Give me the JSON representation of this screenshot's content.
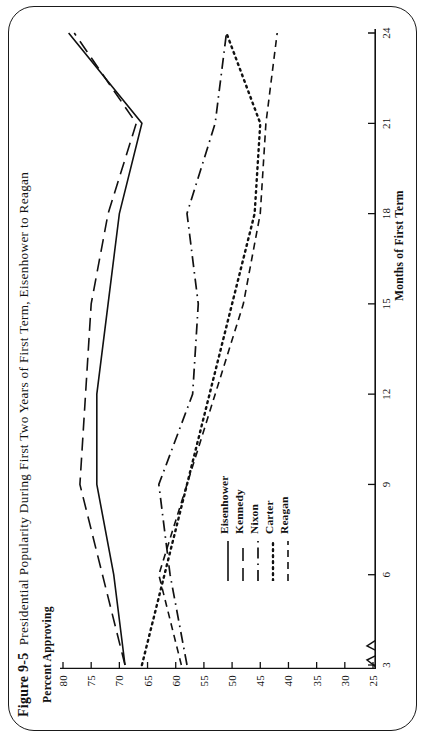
{
  "figure": {
    "number": "Figure 9-5",
    "title": "Presidential Popularity During First Two Years of First Term, Eisenhower to Reagan"
  },
  "axes": {
    "y_caption": "Percent Approving",
    "x_caption": "Months of First Term",
    "y_ticks": [
      "80",
      "75",
      "70",
      "65",
      "60",
      "55",
      "50",
      "45",
      "40",
      "35",
      "30",
      "25"
    ],
    "x_ticks": [
      "3",
      "6",
      "9",
      "12",
      "15",
      "18",
      "21",
      "24"
    ]
  },
  "legend": {
    "items": [
      {
        "label": "Eisenhower",
        "style": "solid"
      },
      {
        "label": "Kennedy",
        "style": "dashed"
      },
      {
        "label": "Nixon",
        "style": "dash-dot"
      },
      {
        "label": "Carter",
        "style": "dotted"
      },
      {
        "label": "Reagan",
        "style": "short-dashed"
      }
    ]
  },
  "chart_data": {
    "type": "line",
    "title": "Presidential Popularity During First Two Years of First Term, Eisenhower to Reagan",
    "xlabel": "Months of First Term",
    "ylabel": "Percent Approving",
    "xlim": [
      3,
      24
    ],
    "ylim": [
      25,
      80
    ],
    "grid": false,
    "legend_position": "lower-center-inside",
    "x": [
      3,
      6,
      9,
      12,
      15,
      18,
      21,
      24
    ],
    "series": [
      {
        "name": "Eisenhower",
        "style": "solid",
        "values": [
          69,
          71,
          74,
          74,
          72,
          70,
          66,
          79
        ]
      },
      {
        "name": "Kennedy",
        "style": "dashed",
        "values": [
          69,
          73,
          77,
          76,
          75,
          72,
          67,
          78
        ]
      },
      {
        "name": "Nixon",
        "style": "dash-dot",
        "values": [
          58,
          61,
          63,
          57,
          56,
          58,
          53,
          51
        ]
      },
      {
        "name": "Carter",
        "style": "dotted",
        "values": [
          66,
          62,
          58,
          54,
          50,
          46,
          45,
          51
        ]
      },
      {
        "name": "Reagan",
        "style": "short-dashed",
        "values": [
          59,
          63,
          58,
          53,
          48,
          45,
          44,
          42
        ]
      }
    ]
  },
  "colors": {
    "ink": "#111111",
    "frame": "#1a1a1a",
    "paper": "#ffffff"
  }
}
